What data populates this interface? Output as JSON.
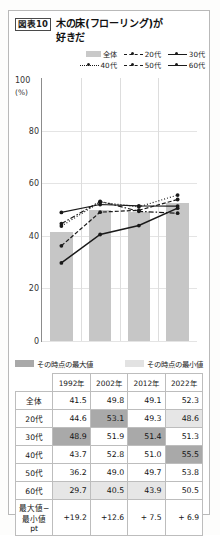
{
  "figure": {
    "tag": "図表10",
    "title": "木の床(フローリング)が\n好きだ",
    "title_line1": "木の床(フローリング)が",
    "title_line2": "好きだ"
  },
  "legend": {
    "items": [
      {
        "label": "全体",
        "style": "bar"
      },
      {
        "label": "20代",
        "style": "dash-dot"
      },
      {
        "label": "30代",
        "style": "solid"
      },
      {
        "label": "40代",
        "style": "dotted"
      },
      {
        "label": "50代",
        "style": "dash"
      },
      {
        "label": "60代",
        "style": "solid"
      }
    ]
  },
  "key": {
    "max_label": "その時点の最大値",
    "min_label": "その時点の最小値",
    "max_color": "#a9a9a9",
    "min_color": "#e2e2e2"
  },
  "axis": {
    "unit": "(%)",
    "ticks": [
      "100",
      "80",
      "60",
      "40",
      "20",
      "0"
    ]
  },
  "table": {
    "columns": [
      "",
      "1992年",
      "2002年",
      "2012年",
      "2022年"
    ],
    "rows": [
      {
        "label": "全体",
        "values": [
          "41.5",
          "49.8",
          "49.1",
          "52.3"
        ],
        "flags": [
          "",
          "",
          "",
          ""
        ]
      },
      {
        "label": "20代",
        "values": [
          "44.6",
          "53.1",
          "49.3",
          "48.6"
        ],
        "flags": [
          "",
          "max",
          "",
          "min"
        ]
      },
      {
        "label": "30代",
        "values": [
          "48.9",
          "51.9",
          "51.4",
          "51.3"
        ],
        "flags": [
          "max",
          "",
          "max",
          ""
        ]
      },
      {
        "label": "40代",
        "values": [
          "43.7",
          "52.8",
          "51.0",
          "55.5"
        ],
        "flags": [
          "",
          "",
          "",
          "max"
        ]
      },
      {
        "label": "50代",
        "values": [
          "36.2",
          "49.0",
          "49.7",
          "53.8"
        ],
        "flags": [
          "",
          "",
          "",
          ""
        ]
      },
      {
        "label": "60代",
        "values": [
          "29.7",
          "40.5",
          "43.9",
          "50.5"
        ],
        "flags": [
          "min",
          "min",
          "min",
          ""
        ]
      }
    ],
    "diff_row": {
      "label": "最大値−\n最小値pt",
      "label_line1": "最大値−",
      "label_line2": "最小値pt",
      "values": [
        "+19.2",
        "+12.6",
        "+ 7.5",
        "+ 6.9"
      ]
    }
  },
  "chart_data": {
    "type": "line",
    "xlabel": "",
    "ylabel": "(%)",
    "ylim": [
      0,
      100
    ],
    "yticks": [
      0,
      20,
      40,
      60,
      80,
      100
    ],
    "grid": true,
    "legend_position": "top-right",
    "categories": [
      "1992年",
      "2002年",
      "2012年",
      "2022年"
    ],
    "bar_series": {
      "name": "全体",
      "values": [
        41.5,
        49.8,
        49.1,
        52.3
      ],
      "color": "#c6c6c6"
    },
    "series": [
      {
        "name": "20代",
        "values": [
          44.6,
          53.1,
          49.3,
          48.6
        ],
        "style": "dash-dot"
      },
      {
        "name": "30代",
        "values": [
          48.9,
          51.9,
          51.4,
          51.3
        ],
        "style": "solid"
      },
      {
        "name": "40代",
        "values": [
          43.7,
          52.8,
          51.0,
          55.5
        ],
        "style": "dotted"
      },
      {
        "name": "50代",
        "values": [
          36.2,
          49.0,
          49.7,
          53.8
        ],
        "style": "dash"
      },
      {
        "name": "60代",
        "values": [
          29.7,
          40.5,
          43.9,
          50.5
        ],
        "style": "solid-thick"
      }
    ]
  }
}
